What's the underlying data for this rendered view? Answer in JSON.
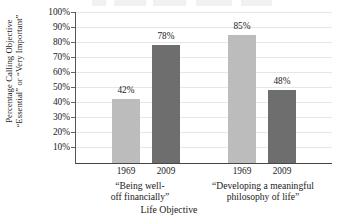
{
  "chart_data": {
    "type": "bar",
    "title": "",
    "xlabel": "Life Objective",
    "ylabel": "Percentage Calling Objective \"Essential\" or \"Very Important\"",
    "ylabel_line1": "Percentage Calling Objective",
    "ylabel_line2": "“Essential” or “Very Important”",
    "categories": [
      "1969",
      "2009",
      "1969",
      "2009"
    ],
    "values": [
      42,
      78,
      85,
      48
    ],
    "value_labels": [
      "42%",
      "78%",
      "85%",
      "48%"
    ],
    "series": [
      {
        "name": "Percentage",
        "values": [
          42,
          78,
          85,
          48
        ]
      }
    ],
    "groups": [
      {
        "label_line1": "“Being well-",
        "label_line2": "off financially”",
        "bars": [
          {
            "category": "1969",
            "value": 42,
            "label": "42%",
            "color": "#bcbcbc"
          },
          {
            "category": "2009",
            "value": 78,
            "label": "78%",
            "color": "#6e6e6e"
          }
        ]
      },
      {
        "label_line1": "“Developing a meaningful",
        "label_line2": "philosophy of life”",
        "bars": [
          {
            "category": "1969",
            "value": 85,
            "label": "85%",
            "color": "#bcbcbc"
          },
          {
            "category": "2009",
            "value": 48,
            "label": "48%",
            "color": "#6e6e6e"
          }
        ]
      }
    ],
    "ylim": [
      0,
      100
    ],
    "ytick_values": [
      100,
      90,
      80,
      70,
      60,
      50,
      40,
      30,
      20,
      10
    ],
    "ytick_labels": [
      "100%",
      "90%",
      "80%",
      "70%",
      "60%",
      "50%",
      "40%",
      "30%",
      "20%",
      "10%"
    ],
    "grid": true,
    "legend": "none",
    "colors": {
      "bar_1969": "#bcbcbc",
      "bar_2009": "#6e6e6e",
      "gridline": "#e6e6e6",
      "axis": "#444444",
      "background": "#ffffff",
      "text": "#1a1a1a"
    }
  }
}
